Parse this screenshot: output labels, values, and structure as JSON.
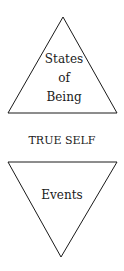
{
  "diagram": {
    "upper_triangle": {
      "lines": [
        "States",
        "of",
        "Being"
      ]
    },
    "center_label": "TRUE SELF",
    "lower_triangle": {
      "lines": [
        "Events"
      ]
    }
  }
}
